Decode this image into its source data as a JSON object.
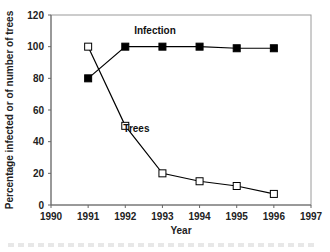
{
  "chart_data": {
    "type": "line",
    "title": "",
    "xlabel": "Year",
    "ylabel": "Percentage infected or of number of trees",
    "xlim": [
      1990,
      1997
    ],
    "ylim": [
      0,
      120
    ],
    "x_ticks": [
      1990,
      1991,
      1992,
      1993,
      1994,
      1995,
      1996,
      1997
    ],
    "y_ticks": [
      0,
      20,
      40,
      60,
      80,
      100,
      120
    ],
    "grid": false,
    "legend": "inline labels",
    "series": [
      {
        "name": "Infection",
        "marker": "filled-square",
        "color": "#000000",
        "x": [
          1991,
          1992,
          1993,
          1994,
          1995,
          1996
        ],
        "values": [
          80,
          100,
          100,
          100,
          99,
          99
        ],
        "label_pos": [
          1992.8,
          108
        ]
      },
      {
        "name": "Trees",
        "marker": "open-square",
        "color": "#000000",
        "x": [
          1991,
          1992,
          1993,
          1994,
          1995,
          1996
        ],
        "values": [
          100,
          50,
          20,
          15,
          12,
          7
        ],
        "label_pos": [
          1992.3,
          46
        ]
      }
    ]
  }
}
